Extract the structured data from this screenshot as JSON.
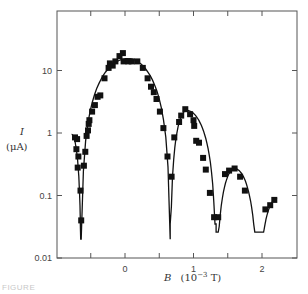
{
  "chart_data": {
    "type": "scatter",
    "title": "",
    "xlabel": "B (10^-3 T)",
    "xlabel_var": "B",
    "xlabel_unit": "(10",
    "xlabel_exp": "−3",
    "xlabel_unit_end": " T)",
    "ylabel": "I (μA)",
    "ylabel_var": "I",
    "ylabel_unit": "(μA)",
    "yscale": "log",
    "xlim": [
      -0.95,
      2.5
    ],
    "ylim": [
      0.01,
      100
    ],
    "x_ticks": [
      -0.5,
      0,
      0.5,
      1,
      1.5,
      2
    ],
    "x_tick_labels": [
      {
        "value": 0,
        "label": "0"
      },
      {
        "value": 1,
        "label": "1"
      },
      {
        "value": 2,
        "label": "2"
      }
    ],
    "y_ticks": [
      0.01,
      0.1,
      1,
      10
    ],
    "y_tick_labels": [
      {
        "value": 0.01,
        "label": "0.01"
      },
      {
        "value": 0.1,
        "label": "0.1"
      },
      {
        "value": 1,
        "label": "1"
      },
      {
        "value": 10,
        "label": "10"
      }
    ],
    "grid": false,
    "legend": null,
    "series": [
      {
        "name": "measured",
        "marker": "square",
        "points": [
          {
            "x": -0.73,
            "y": 0.85
          },
          {
            "x": -0.7,
            "y": 0.8
          },
          {
            "x": -0.71,
            "y": 0.55
          },
          {
            "x": -0.68,
            "y": 0.42
          },
          {
            "x": -0.69,
            "y": 0.28
          },
          {
            "x": -0.65,
            "y": 0.12
          },
          {
            "x": -0.64,
            "y": 0.04
          },
          {
            "x": -0.6,
            "y": 0.3
          },
          {
            "x": -0.58,
            "y": 0.5
          },
          {
            "x": -0.56,
            "y": 0.9
          },
          {
            "x": -0.54,
            "y": 1.1
          },
          {
            "x": -0.53,
            "y": 1.4
          },
          {
            "x": -0.52,
            "y": 1.6
          },
          {
            "x": -0.48,
            "y": 2.2
          },
          {
            "x": -0.44,
            "y": 2.8
          },
          {
            "x": -0.4,
            "y": 3.8
          },
          {
            "x": -0.36,
            "y": 4.0
          },
          {
            "x": -0.3,
            "y": 7.5
          },
          {
            "x": -0.24,
            "y": 11
          },
          {
            "x": -0.22,
            "y": 13
          },
          {
            "x": -0.18,
            "y": 12
          },
          {
            "x": -0.14,
            "y": 14
          },
          {
            "x": -0.08,
            "y": 17
          },
          {
            "x": -0.03,
            "y": 19
          },
          {
            "x": -0.02,
            "y": 14
          },
          {
            "x": 0.05,
            "y": 14
          },
          {
            "x": 0.1,
            "y": 14
          },
          {
            "x": 0.18,
            "y": 14
          },
          {
            "x": 0.26,
            "y": 11
          },
          {
            "x": 0.33,
            "y": 7.5
          },
          {
            "x": 0.38,
            "y": 5.5
          },
          {
            "x": 0.42,
            "y": 4.5
          },
          {
            "x": 0.46,
            "y": 3.5
          },
          {
            "x": 0.51,
            "y": 2.2
          },
          {
            "x": 0.56,
            "y": 1.2
          },
          {
            "x": 0.62,
            "y": 0.42
          },
          {
            "x": 0.68,
            "y": 0.2
          },
          {
            "x": 0.72,
            "y": 0.85
          },
          {
            "x": 0.79,
            "y": 1.5
          },
          {
            "x": 0.82,
            "y": 1.9
          },
          {
            "x": 0.88,
            "y": 2.4
          },
          {
            "x": 0.95,
            "y": 2.0
          },
          {
            "x": 1.0,
            "y": 1.6
          },
          {
            "x": 1.01,
            "y": 1.3
          },
          {
            "x": 1.04,
            "y": 0.75
          },
          {
            "x": 1.08,
            "y": 0.7
          },
          {
            "x": 1.14,
            "y": 0.4
          },
          {
            "x": 1.18,
            "y": 0.26
          },
          {
            "x": 1.24,
            "y": 0.11
          },
          {
            "x": 1.3,
            "y": 0.045
          },
          {
            "x": 1.36,
            "y": 0.045
          },
          {
            "x": 1.46,
            "y": 0.22
          },
          {
            "x": 1.52,
            "y": 0.25
          },
          {
            "x": 1.6,
            "y": 0.27
          },
          {
            "x": 1.68,
            "y": 0.2
          },
          {
            "x": 1.75,
            "y": 0.12
          },
          {
            "x": 2.05,
            "y": 0.06
          },
          {
            "x": 2.12,
            "y": 0.07
          },
          {
            "x": 2.18,
            "y": 0.085
          }
        ]
      },
      {
        "name": "theory",
        "type": "line",
        "description": "Fraunhofer-like single-junction interference curve with minima near B ≈ -0.64, 0.66, 1.33, 1.94 (×10^-3 T)",
        "minima_x": [
          -0.64,
          0.66,
          1.33,
          1.94
        ],
        "peaks": [
          {
            "x": 0.05,
            "y": 15
          },
          {
            "x": 0.9,
            "y": 2.3
          },
          {
            "x": 1.62,
            "y": 0.27
          }
        ]
      }
    ]
  },
  "caption_fragment": "FIGURE"
}
